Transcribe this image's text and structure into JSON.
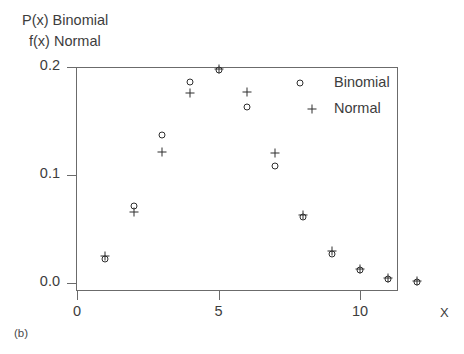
{
  "figure": {
    "panel_label": "(b)",
    "axis_title_line_1": "P(x)  Binomial",
    "axis_title_line_2": "f(x) Normal",
    "x_axis_caption": "X"
  },
  "legend": {
    "position": "top-right-inside",
    "entries": [
      {
        "label": "Binomial",
        "marker": "circle-marker"
      },
      {
        "label": "Normal",
        "marker": "plus-marker"
      }
    ]
  },
  "chart_data": {
    "type": "scatter",
    "title": "",
    "subtitle": "",
    "xlabel": "X",
    "ylabel": "P(x)  Binomial / f(x) Normal",
    "xlim": [
      0,
      12.4
    ],
    "ylim": [
      0.0,
      0.21
    ],
    "grid": false,
    "legend_position": "upper right",
    "xticks": [
      0,
      5,
      10
    ],
    "xtick_labels": [
      "0",
      "5",
      "10"
    ],
    "yticks": [
      0.0,
      0.1,
      0.2
    ],
    "ytick_labels": [
      "0.0",
      "0.1",
      "0.2"
    ],
    "x": [
      1,
      2,
      3,
      4,
      5,
      6,
      7,
      8,
      9,
      10,
      11,
      12
    ],
    "series": [
      {
        "name": "Binomial",
        "marker": "circle",
        "values": [
          0.022,
          0.071,
          0.137,
          0.186,
          0.197,
          0.163,
          0.108,
          0.061,
          0.027,
          0.012,
          0.004,
          0.001
        ]
      },
      {
        "name": "Normal",
        "marker": "plus",
        "values": [
          0.025,
          0.066,
          0.121,
          0.176,
          0.198,
          0.177,
          0.12,
          0.063,
          0.03,
          0.013,
          0.005,
          0.002
        ]
      }
    ]
  }
}
